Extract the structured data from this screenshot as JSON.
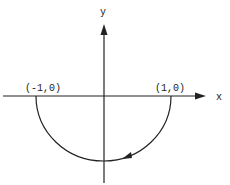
{
  "diagram": {
    "title": "",
    "axes": {
      "x_label": "x",
      "y_label": "y"
    },
    "points": [
      {
        "label": "(-1,0)",
        "x": -1,
        "y": 0
      },
      {
        "label": "(1,0)",
        "x": 1,
        "y": 0
      }
    ],
    "path": {
      "description": "lower semicircle from (1,0) to (-1,0), traversed clockwise",
      "direction_arrow": "pointing toward decreasing x along lower arc"
    },
    "colors": {
      "stroke": "#222222",
      "background": "#ffffff"
    }
  }
}
